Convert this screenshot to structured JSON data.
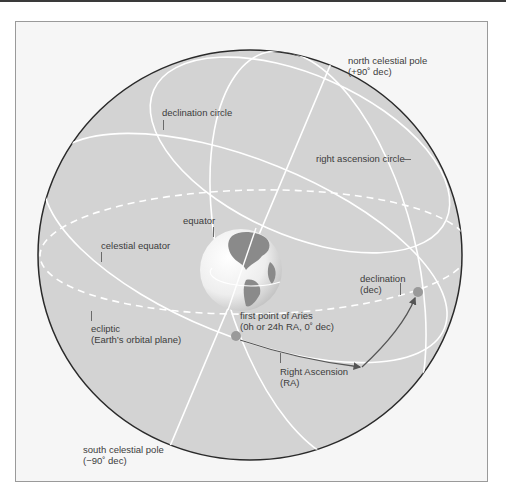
{
  "figure": {
    "colors": {
      "sphere_fill": "#d3d3d3",
      "sphere_stroke": "#2a2a2a",
      "circle_lines": "#ffffff",
      "arrow": "#555555",
      "frame_bg": "#f6f6f6",
      "label_text": "#3c3c3c"
    }
  },
  "labels": {
    "north_pole_line1": "north celestial pole",
    "north_pole_line2": "(+90˚ dec)",
    "declination_circle": "declination circle",
    "right_ascension_circle": "right ascension circle",
    "equator": "equator",
    "celestial_equator": "celestial equator",
    "ecliptic_line1": "ecliptic",
    "ecliptic_line2": "(Earth’s orbital plane)",
    "aries_line1": "first point of Aries",
    "aries_line2": "(0h or 24h RA, 0˚ dec)",
    "declination_line1": "declination",
    "declination_line2": "(dec)",
    "ra_line1": "Right Ascension",
    "ra_line2": "(RA)",
    "south_pole_line1": "south celestial pole",
    "south_pole_line2": "(−90˚ dec)"
  }
}
